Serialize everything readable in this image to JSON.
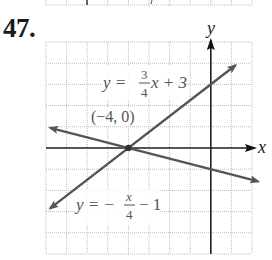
{
  "problem": {
    "number": "47."
  },
  "chart_data": {
    "type": "line",
    "title": "",
    "xlabel": "x",
    "ylabel": "y",
    "xlim": [
      -8,
      2
    ],
    "ylim": [
      -5,
      5
    ],
    "grid": true,
    "grid_step": 1,
    "series": [
      {
        "name": "y = 3/4 x + 3",
        "equation": "y = (3/4)x + 3",
        "slope": 0.75,
        "intercept": 3,
        "x": [
          -7.8,
          1.2
        ],
        "y": [
          -2.85,
          3.9
        ]
      },
      {
        "name": "y = -x/4 - 1",
        "equation": "y = -x/4 - 1",
        "slope": -0.25,
        "intercept": -1,
        "x": [
          -7.8,
          2.3
        ],
        "y": [
          0.95,
          -1.575
        ]
      }
    ],
    "annotations": [
      {
        "text": "(-4, 0)",
        "x": -4,
        "y": 0,
        "type": "intersection-point"
      }
    ],
    "colors": {
      "lines": "#555555",
      "axes": "#222222",
      "grid": "#bdbdbd"
    }
  },
  "labels": {
    "x_axis": "x",
    "y_axis": "y",
    "point": "(−4, 0)",
    "eq1": {
      "lhs": "y = ",
      "num": "3",
      "den": "4",
      "rest": "x + 3"
    },
    "eq2": {
      "lhs": "y = −",
      "num": "x",
      "den": "4",
      "rest": "− 1"
    }
  }
}
